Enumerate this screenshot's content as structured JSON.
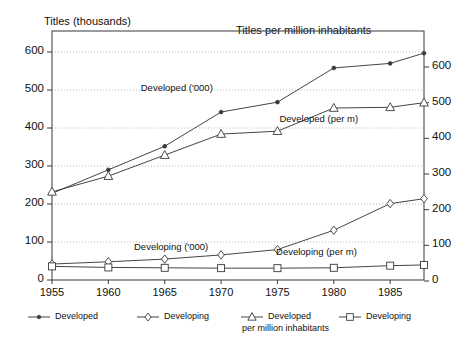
{
  "chart_data": {
    "type": "line",
    "title": "",
    "left_axis": {
      "label": "Titles (thousands)",
      "ticks": [
        0,
        100,
        200,
        300,
        400,
        500,
        600
      ],
      "ylim": [
        0,
        650
      ]
    },
    "right_axis": {
      "label": "Titles per million inhabitants",
      "ticks": [
        0,
        100,
        200,
        300,
        400,
        500,
        600
      ],
      "ylim": [
        0,
        660
      ]
    },
    "x": [
      1955,
      1960,
      1965,
      1970,
      1975,
      1980,
      1985,
      1988
    ],
    "xlabel": "",
    "xticks": [
      "1955",
      "1960",
      "1965",
      "1970",
      "1975",
      "1980",
      "1985"
    ],
    "grid": true,
    "legend_position": "bottom",
    "series": [
      {
        "name": "Developed",
        "annotation": "Developed ('000)",
        "axis": "left",
        "marker": "filled-dot",
        "values": [
          228,
          290,
          352,
          442,
          468,
          558,
          570,
          597
        ]
      },
      {
        "name": "Developing",
        "annotation": "Developing ('000)",
        "axis": "left",
        "marker": "diamond",
        "values": [
          42,
          48,
          55,
          66,
          80,
          131,
          201,
          214
        ]
      },
      {
        "name": "Developed per million inhabitants",
        "annotation": "Developed (per m)",
        "axis": "right",
        "marker": "triangle",
        "values": [
          250,
          294,
          353,
          412,
          420,
          485,
          487,
          500
        ]
      },
      {
        "name": "Developing per million inhabitants",
        "annotation": "Developing (per m)",
        "axis": "right",
        "marker": "square",
        "values": [
          41,
          38,
          37,
          36,
          36,
          37,
          43,
          45
        ]
      }
    ],
    "annotations": [
      {
        "text": "Developed ('000)",
        "x": 1966.6,
        "y": 505,
        "axis": "left"
      },
      {
        "text": "Developed (per m)",
        "x": 1978.9,
        "y": 455,
        "axis": "right"
      },
      {
        "text": "Developing ('000)",
        "x": 1966.0,
        "y": 88,
        "axis": "left"
      },
      {
        "text": "Developing (per m)",
        "x": 1978.6,
        "y": 82,
        "axis": "right"
      }
    ]
  },
  "legend": {
    "items": [
      {
        "label": "Developed",
        "label2": "",
        "marker": "filled-dot"
      },
      {
        "label": "Developing",
        "label2": "",
        "marker": "diamond"
      },
      {
        "label": "Developed",
        "label2": "per million inhabitants",
        "marker": "triangle"
      },
      {
        "label": "Developing",
        "label2": "",
        "marker": "square"
      }
    ]
  },
  "colors": {
    "line": "#3a3a3a",
    "grid": "#b8b8b8",
    "axis": "#4a4a4a",
    "text": "#111111",
    "background": "#ffffff"
  }
}
